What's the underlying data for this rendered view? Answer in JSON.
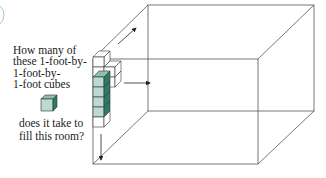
{
  "figure": {
    "question_lines_top": [
      "How many of",
      "these 1-foot-by-",
      "1-foot-by-",
      "1-foot cubes"
    ],
    "question_lines_bottom": [
      "does it take to",
      "fill this room?"
    ],
    "unit_cube_icon": "cube-icon",
    "room_label": "room-box",
    "colors": {
      "cube_fill_front": "#bcd9d2",
      "cube_fill_side": "#2f7a66",
      "cube_fill_top": "#8fbdb1",
      "line": "#444444",
      "marker": "#cfe6e2"
    }
  }
}
